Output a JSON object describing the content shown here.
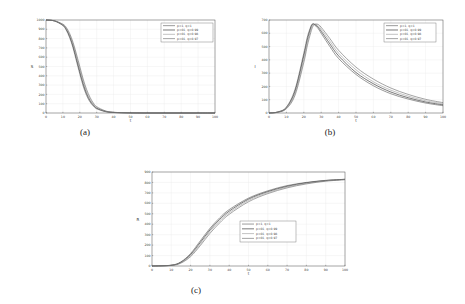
{
  "figure": {
    "captions": [
      "(a)",
      "(b)",
      "(c)"
    ]
  },
  "chart_data": [
    {
      "type": "line",
      "panel": "(a)",
      "title": "",
      "xlabel": "t",
      "ylabel": "S",
      "xlim": [
        0,
        100
      ],
      "ylim": [
        0,
        1000
      ],
      "xticks": [
        0,
        10,
        20,
        30,
        40,
        50,
        60,
        70,
        80,
        90,
        100
      ],
      "yticks": [
        0,
        100,
        200,
        300,
        400,
        500,
        600,
        700,
        800,
        900,
        1000
      ],
      "grid": true,
      "legend_position": "upper right",
      "x": [
        0,
        5,
        10,
        12,
        14,
        16,
        18,
        20,
        22,
        24,
        26,
        28,
        30,
        35,
        40,
        50,
        60,
        70,
        80,
        90,
        100
      ],
      "series": [
        {
          "name": "p=1, q=1",
          "values": [
            1000,
            990,
            940,
            890,
            810,
            700,
            560,
            420,
            290,
            190,
            120,
            75,
            45,
            15,
            5,
            1,
            0,
            0,
            0,
            0,
            0
          ]
        },
        {
          "name": "p=01, q=0.99",
          "values": [
            1000,
            990,
            945,
            900,
            825,
            720,
            585,
            445,
            315,
            210,
            135,
            85,
            52,
            18,
            6,
            1,
            0,
            0,
            0,
            0,
            0
          ]
        },
        {
          "name": "p=01, q=0.98",
          "values": [
            1000,
            991,
            950,
            910,
            840,
            740,
            610,
            470,
            340,
            230,
            150,
            95,
            60,
            20,
            7,
            1,
            0,
            0,
            0,
            0,
            0
          ]
        },
        {
          "name": "p=01, q=0.97",
          "values": [
            1000,
            992,
            955,
            920,
            855,
            760,
            635,
            500,
            365,
            255,
            170,
            108,
            68,
            24,
            8,
            1,
            0,
            0,
            0,
            0,
            0
          ]
        }
      ]
    },
    {
      "type": "line",
      "panel": "(b)",
      "title": "",
      "xlabel": "t",
      "ylabel": "I",
      "xlim": [
        0,
        100
      ],
      "ylim": [
        0,
        700
      ],
      "xticks": [
        0,
        10,
        20,
        30,
        40,
        50,
        60,
        70,
        80,
        90,
        100
      ],
      "yticks": [
        0,
        100,
        200,
        300,
        400,
        500,
        600,
        700
      ],
      "grid": true,
      "legend_position": "upper right",
      "x": [
        0,
        5,
        10,
        15,
        20,
        22,
        24,
        25,
        26,
        28,
        30,
        35,
        40,
        50,
        60,
        70,
        80,
        90,
        100
      ],
      "series": [
        {
          "name": "p=1, q=1",
          "values": [
            0,
            8,
            45,
            180,
            450,
            570,
            650,
            670,
            665,
            640,
            600,
            500,
            410,
            290,
            205,
            145,
            105,
            75,
            55
          ]
        },
        {
          "name": "p=01, q=0.99",
          "values": [
            0,
            7,
            40,
            165,
            430,
            550,
            640,
            668,
            668,
            650,
            615,
            520,
            430,
            305,
            220,
            158,
            115,
            83,
            62
          ]
        },
        {
          "name": "p=01, q=0.98",
          "values": [
            0,
            6,
            36,
            150,
            405,
            530,
            625,
            660,
            670,
            660,
            630,
            540,
            450,
            325,
            235,
            172,
            127,
            92,
            70
          ]
        },
        {
          "name": "p=01, q=0.97",
          "values": [
            0,
            5,
            32,
            135,
            380,
            505,
            605,
            645,
            665,
            668,
            645,
            560,
            472,
            345,
            255,
            188,
            140,
            103,
            78
          ]
        }
      ]
    },
    {
      "type": "line",
      "panel": "(c)",
      "title": "",
      "xlabel": "t",
      "ylabel": "R",
      "xlim": [
        0,
        100
      ],
      "ylim": [
        0,
        900
      ],
      "xticks": [
        0,
        10,
        20,
        30,
        40,
        50,
        60,
        70,
        80,
        90,
        100
      ],
      "yticks": [
        0,
        100,
        200,
        300,
        400,
        500,
        600,
        700,
        800,
        900
      ],
      "grid": true,
      "legend_position": "center right",
      "x": [
        0,
        10,
        15,
        20,
        25,
        30,
        35,
        40,
        50,
        60,
        70,
        80,
        90,
        100
      ],
      "series": [
        {
          "name": "p=1, q=1",
          "values": [
            0,
            8,
            40,
            120,
            240,
            360,
            460,
            540,
            650,
            720,
            770,
            800,
            820,
            830
          ]
        },
        {
          "name": "p=01, q=0.99",
          "values": [
            0,
            7,
            36,
            110,
            225,
            345,
            445,
            525,
            640,
            712,
            763,
            797,
            818,
            830
          ]
        },
        {
          "name": "p=01, q=0.98",
          "values": [
            0,
            6,
            32,
            100,
            210,
            330,
            430,
            510,
            628,
            703,
            757,
            792,
            815,
            828
          ]
        },
        {
          "name": "p=01, q=0.97",
          "values": [
            0,
            5,
            28,
            90,
            195,
            312,
            412,
            495,
            615,
            693,
            748,
            786,
            812,
            826
          ]
        }
      ]
    }
  ]
}
